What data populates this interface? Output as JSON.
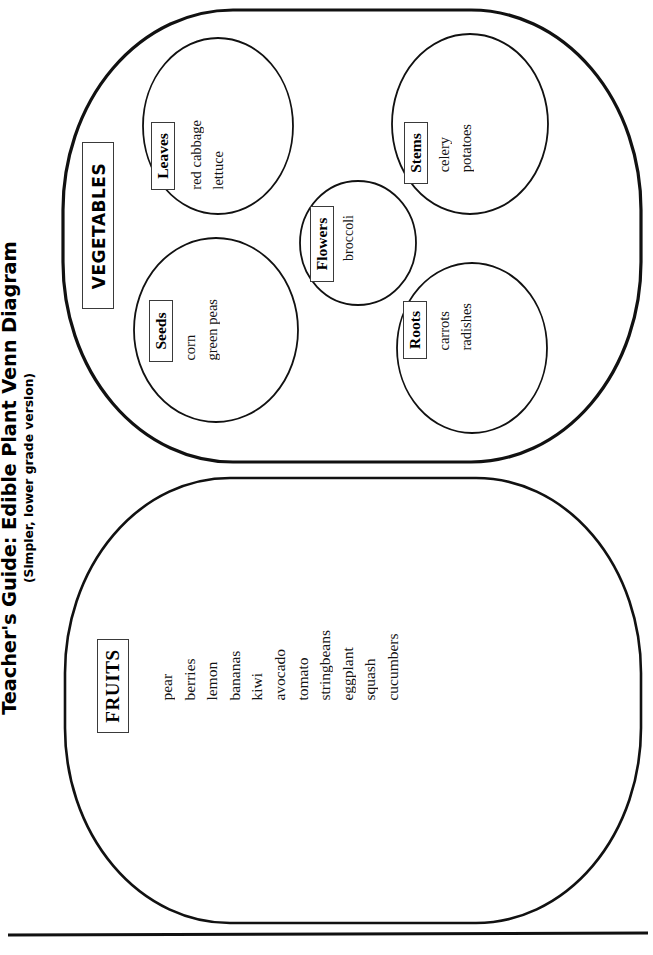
{
  "header": {
    "title": "Teacher's Guide: Edible Plant Venn Diagram",
    "subtitle": "(Simpler, lower grade version)"
  },
  "diagram": {
    "type": "venn",
    "orientation": "rotated-90-ccw",
    "groups": [
      {
        "id": "vegetables",
        "label": "VEGETABLES",
        "shape": "rounded-rectangle",
        "subgroups": [
          {
            "id": "leaves",
            "label": "Leaves",
            "shape": "circle",
            "items": [
              "red cabbage",
              "lettuce"
            ]
          },
          {
            "id": "stems",
            "label": "Stems",
            "shape": "circle",
            "items": [
              "celery",
              "potatoes"
            ]
          },
          {
            "id": "flowers",
            "label": "Flowers",
            "shape": "circle",
            "items": [
              "broccoli"
            ]
          },
          {
            "id": "seeds",
            "label": "Seeds",
            "shape": "circle",
            "items": [
              "corn",
              "green peas"
            ]
          },
          {
            "id": "roots",
            "label": "Roots",
            "shape": "circle",
            "items": [
              "carrots",
              "radishes"
            ]
          }
        ]
      },
      {
        "id": "fruits",
        "label": "FRUITS",
        "shape": "rounded-rectangle",
        "subgroups": [],
        "items": [
          "pear",
          "berries",
          "lemon",
          "bananas",
          "kiwi",
          "avocado",
          "tomato",
          "stringbeans",
          "eggplant",
          "squash",
          "cucumbers"
        ]
      }
    ]
  },
  "colors": {
    "page_background": "#ffffff",
    "outline": "#111111",
    "text": "#111111",
    "caption_border": "#3a3a3a"
  }
}
